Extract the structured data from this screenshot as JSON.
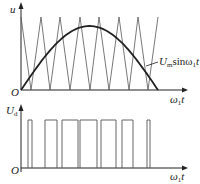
{
  "top_plot": {
    "y_axis_label": "u",
    "x_axis_label": "ω",
    "x_axis_label_sub": "1",
    "x_axis_label_tail": "t",
    "origin_label": "O",
    "curve_label_main": "U",
    "curve_label_sub": "m",
    "curve_label_mid": "sinω",
    "curve_label_sub2": "1",
    "curve_label_tail": "t",
    "triangle_peaks_x": [
      21,
      41,
      60,
      80,
      99,
      119,
      138,
      158
    ],
    "triangle_troughs_x": [
      31,
      50,
      70,
      90,
      109,
      129,
      148
    ],
    "sine_start_x": 21,
    "sine_end_x": 158,
    "sine_peak_y": 26,
    "baseline_y": 90,
    "top_y": 17
  },
  "bottom_plot": {
    "y_axis_label": "U",
    "y_axis_label_sub": "d",
    "x_axis_label": "ω",
    "x_axis_label_sub": "1",
    "x_axis_label_tail": "t",
    "origin_label": "O",
    "baseline_y": 168,
    "pulse_top_y": 120,
    "pulses": [
      [
        28,
        32
      ],
      [
        45,
        57
      ],
      [
        62,
        78
      ],
      [
        80,
        97
      ],
      [
        101,
        116
      ],
      [
        122,
        133
      ],
      [
        147,
        150
      ]
    ]
  },
  "colors": {
    "line": "#222222",
    "thin": "#555555"
  }
}
